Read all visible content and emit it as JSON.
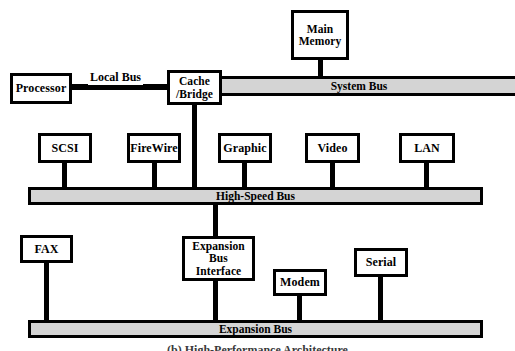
{
  "figure": {
    "caption": "(b) High-Performance Architecture"
  },
  "colors": {
    "bus_fill": "#d4d4d4",
    "stroke": "#000000",
    "node_fill": "#ffffff",
    "background": "#ffffff"
  },
  "labels": {
    "local_bus": "Local Bus"
  },
  "buses": [
    {
      "id": "system_bus",
      "label": "System Bus"
    },
    {
      "id": "high_speed_bus",
      "label": "High-Speed Bus"
    },
    {
      "id": "expansion_bus",
      "label": "Expansion Bus"
    }
  ],
  "nodes": {
    "processor": "Processor",
    "cache_bridge_line1": "Cache",
    "cache_bridge_line2": "/Bridge",
    "main_memory_line1": "Main",
    "main_memory_line2": "Memory",
    "scsi": "SCSI",
    "firewire": "FireWire",
    "graphic": "Graphic",
    "video": "Video",
    "lan": "LAN",
    "fax": "FAX",
    "expansion_bus_interface_line1": "Expansion",
    "expansion_bus_interface_line2": "Bus Interface",
    "modem": "Modem",
    "serial": "Serial"
  }
}
